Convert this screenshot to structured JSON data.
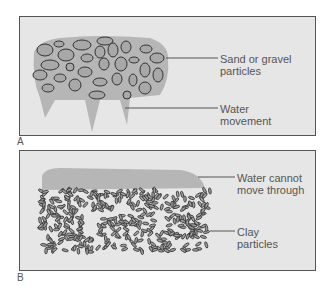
{
  "panels": [
    {
      "id": "A",
      "letter": "A",
      "labels": [
        "Sand or gravel particles",
        "Water movement"
      ]
    },
    {
      "id": "B",
      "letter": "B",
      "labels": [
        "Water cannot move through",
        "Clay particles"
      ]
    }
  ],
  "text": {
    "a_label1_l1": "Sand or gravel",
    "a_label1_l2": "particles",
    "a_label2_l1": "Water",
    "a_label2_l2": "movement",
    "b_label1_l1": "Water cannot",
    "b_label1_l2": "move through",
    "b_label2_l1": "Clay",
    "b_label2_l2": "particles",
    "a": "A",
    "b": "B"
  },
  "colors": {
    "panel_bg": "#e6e6e6",
    "water": "#b4b4b4",
    "particle": "#a8a8a8",
    "outline": "#333333"
  }
}
